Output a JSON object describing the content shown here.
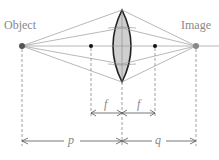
{
  "diagram": {
    "labels": {
      "object": "Object",
      "image": "Image",
      "focal_left": "f",
      "focal_right": "f",
      "object_distance": "p",
      "image_distance": "q"
    },
    "colors": {
      "rays": "#999999",
      "lens_fill": "#cfcfcf",
      "lens_stroke": "#222222",
      "text": "#888888",
      "dashed": "#888888"
    }
  }
}
